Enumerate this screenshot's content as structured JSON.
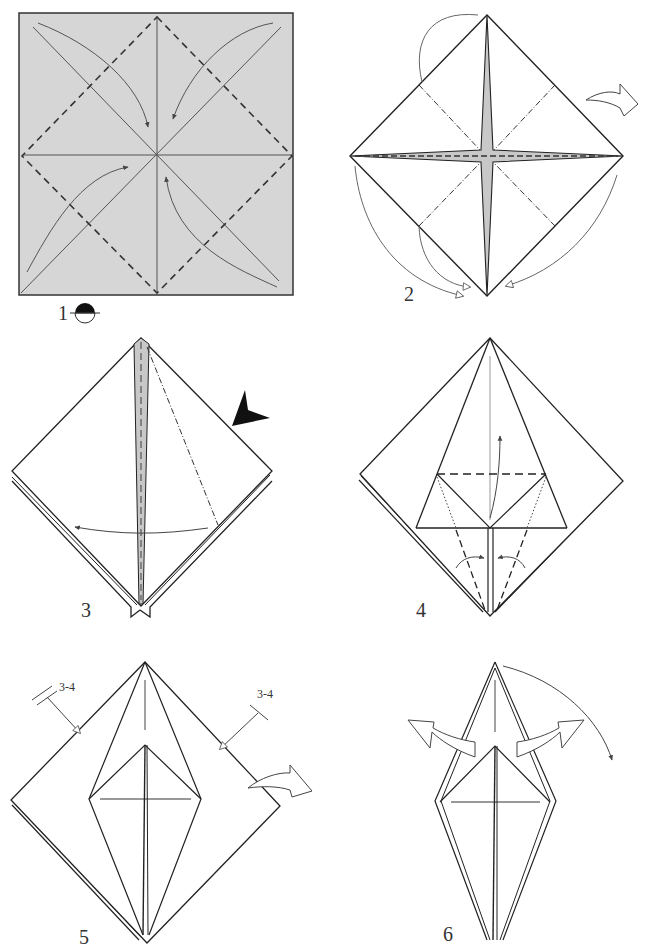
{
  "diagram": {
    "type": "origami-instructions",
    "steps": [
      {
        "number": "1",
        "description": "Colored square with crease pattern: valley folds along diagonals and midlines, dashed inner diamond; arrows bring corners to center",
        "symbol": "turn-over-icon"
      },
      {
        "number": "2",
        "description": "Blintz base diamond with mountain-fold (dot-dash) lines; arrows fold flaps behind; hollow turn-over arrow at right"
      },
      {
        "number": "3",
        "description": "Square base kite; squash fold indicated by black push arrow on right edge; curved arrow swings flap left"
      },
      {
        "number": "4",
        "description": "Petal fold preparation: horizontal valley line, arrow lifts flap up; side edges fold to centre"
      },
      {
        "number": "5",
        "description": "Repeat arrows on both sides; hollow turn-over arrow at right",
        "repeat_labels": [
          "3-4",
          "3-4"
        ]
      },
      {
        "number": "6",
        "description": "Narrow diamond; hollow arrows pull out points on both sides; curved arrow folds tip down"
      }
    ]
  },
  "labels": {
    "step1": "1",
    "step2": "2",
    "step3": "3",
    "step4": "4",
    "step5": "5",
    "step6": "6",
    "repeat_left": "3-4",
    "repeat_right": "3-4"
  },
  "colors": {
    "paper_colored": "#d6d6d6",
    "paper_white": "#ffffff",
    "line": "#222222",
    "arrow": "#555555",
    "flap_gray": "#c8c8c8"
  }
}
